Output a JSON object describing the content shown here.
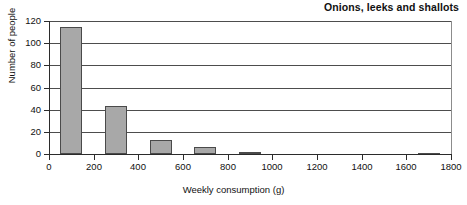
{
  "chart_data": {
    "type": "bar",
    "title": "Onions, leeks and shallots",
    "xlabel": "Weekly consumption (g)",
    "ylabel": "Number of people",
    "xlim": [
      0,
      1800
    ],
    "ylim": [
      0,
      120
    ],
    "xticks": [
      0,
      200,
      400,
      600,
      800,
      1000,
      1200,
      1400,
      1600,
      1800
    ],
    "yticks": [
      0,
      20,
      40,
      60,
      80,
      100,
      120
    ],
    "grid": "horizontal",
    "legend": "none",
    "bar_color": "#a8a8a8",
    "bar_edge_color": "#4a4a4a",
    "bins": [
      {
        "label": "50-150",
        "start": 50,
        "end": 150,
        "value": 115
      },
      {
        "label": "250-350",
        "start": 250,
        "end": 350,
        "value": 43
      },
      {
        "label": "450-550",
        "start": 450,
        "end": 550,
        "value": 13
      },
      {
        "label": "650-750",
        "start": 650,
        "end": 750,
        "value": 6
      },
      {
        "label": "850-950",
        "start": 850,
        "end": 950,
        "value": 2
      },
      {
        "label": "1650-1750",
        "start": 1650,
        "end": 1750,
        "value": 1
      }
    ],
    "categories": [
      "50-150",
      "250-350",
      "450-550",
      "650-750",
      "850-950",
      "1650-1750"
    ],
    "values": [
      115,
      43,
      13,
      6,
      2,
      1
    ]
  }
}
